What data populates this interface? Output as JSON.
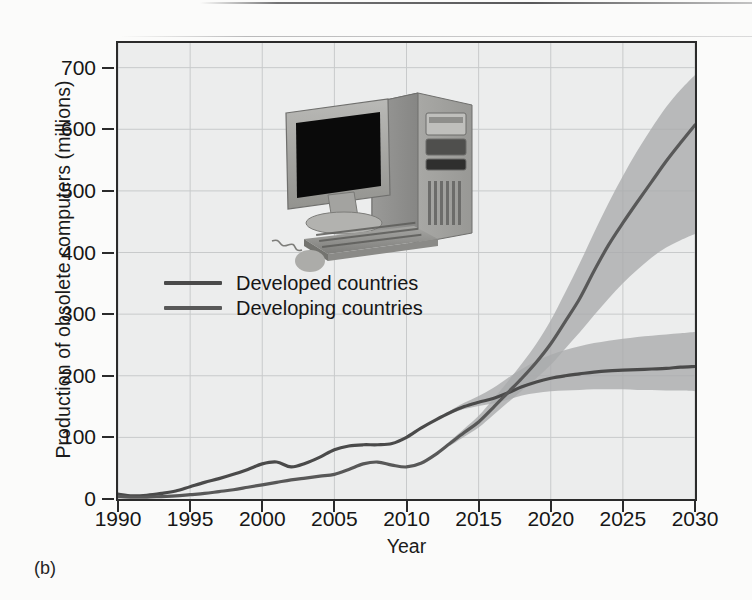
{
  "figure": {
    "panel_letter": "(b)"
  },
  "chart_data": {
    "type": "line",
    "title": "",
    "xlabel": "Year",
    "ylabel": "Production of obsolete computers (millions)",
    "xlim": [
      1990,
      2030
    ],
    "ylim": [
      0,
      740
    ],
    "xticks": [
      1990,
      1995,
      2000,
      2005,
      2010,
      2015,
      2020,
      2025,
      2030
    ],
    "yticks": [
      0,
      100,
      200,
      300,
      400,
      500,
      600,
      700
    ],
    "grid": true,
    "legend_position": "upper left inside",
    "band_note": "shaded grey uncertainty band around each projected line after ~2013",
    "series": [
      {
        "name": "Developed countries",
        "color": "#4a4a4a",
        "x": [
          1990,
          1991,
          1992,
          1993,
          1994,
          1995,
          1996,
          1997,
          1998,
          1999,
          2000,
          2001,
          2002,
          2003,
          2004,
          2005,
          2006,
          2007,
          2008,
          2009,
          2010,
          2011,
          2012,
          2013,
          2014,
          2015,
          2016,
          2017,
          2018,
          2019,
          2020,
          2021,
          2022,
          2023,
          2024,
          2025,
          2026,
          2027,
          2028,
          2029,
          2030
        ],
        "values": [
          8,
          5,
          6,
          9,
          13,
          20,
          27,
          33,
          40,
          48,
          57,
          60,
          52,
          58,
          68,
          80,
          86,
          88,
          88,
          90,
          100,
          115,
          128,
          140,
          150,
          157,
          163,
          172,
          182,
          190,
          196,
          200,
          203,
          206,
          208,
          209,
          210,
          211,
          212,
          214,
          215
        ],
        "band_lower": [
          null,
          null,
          null,
          null,
          null,
          null,
          null,
          null,
          null,
          null,
          null,
          null,
          null,
          null,
          null,
          null,
          null,
          null,
          null,
          null,
          null,
          null,
          null,
          138,
          146,
          151,
          155,
          161,
          168,
          172,
          175,
          176,
          177,
          178,
          178,
          178,
          177,
          177,
          176,
          176,
          175
        ],
        "band_upper": [
          null,
          null,
          null,
          null,
          null,
          null,
          null,
          null,
          null,
          null,
          null,
          null,
          null,
          null,
          null,
          null,
          null,
          null,
          null,
          null,
          null,
          null,
          null,
          143,
          156,
          167,
          180,
          196,
          211,
          224,
          234,
          242,
          248,
          253,
          257,
          260,
          263,
          265,
          267,
          269,
          271
        ]
      },
      {
        "name": "Developing countries",
        "color": "#585858",
        "x": [
          1990,
          1991,
          1992,
          1993,
          1994,
          1995,
          1996,
          1997,
          1998,
          1999,
          2000,
          2001,
          2002,
          2003,
          2004,
          2005,
          2006,
          2007,
          2008,
          2009,
          2010,
          2011,
          2012,
          2013,
          2014,
          2015,
          2016,
          2017,
          2018,
          2019,
          2020,
          2021,
          2022,
          2023,
          2024,
          2025,
          2026,
          2027,
          2028,
          2029,
          2030
        ],
        "values": [
          4,
          3,
          3,
          4,
          5,
          7,
          9,
          12,
          15,
          19,
          23,
          27,
          31,
          34,
          37,
          40,
          48,
          57,
          60,
          55,
          52,
          58,
          72,
          90,
          108,
          125,
          148,
          172,
          196,
          222,
          252,
          288,
          325,
          370,
          412,
          448,
          482,
          515,
          548,
          578,
          607
        ],
        "band_lower": [
          null,
          null,
          null,
          null,
          null,
          null,
          null,
          null,
          null,
          null,
          null,
          null,
          null,
          null,
          null,
          null,
          null,
          null,
          null,
          null,
          null,
          null,
          null,
          86,
          101,
          116,
          136,
          156,
          176,
          196,
          218,
          244,
          270,
          298,
          325,
          350,
          372,
          392,
          408,
          420,
          430
        ],
        "band_upper": [
          null,
          null,
          null,
          null,
          null,
          null,
          null,
          null,
          null,
          null,
          null,
          null,
          null,
          null,
          null,
          null,
          null,
          null,
          null,
          null,
          null,
          null,
          null,
          94,
          114,
          135,
          162,
          190,
          220,
          252,
          290,
          335,
          382,
          432,
          480,
          524,
          565,
          602,
          636,
          664,
          688
        ]
      }
    ]
  },
  "legend": {
    "items": [
      {
        "label": "Developed countries",
        "color": "#4a4a4a"
      },
      {
        "label": "Developing countries",
        "color": "#585858"
      }
    ]
  },
  "illustration": {
    "name": "desktop-computer",
    "parts": [
      "monitor",
      "tower-case",
      "keyboard",
      "mouse",
      "mouse-cable"
    ]
  },
  "colors": {
    "plot_background": "#eceded",
    "page_background": "#fbfbfa",
    "axis": "#2b2b2b",
    "gridline": "#c8cacb",
    "band": "#a9abac",
    "line_developed": "#4a4a4a",
    "line_developing": "#585858"
  }
}
